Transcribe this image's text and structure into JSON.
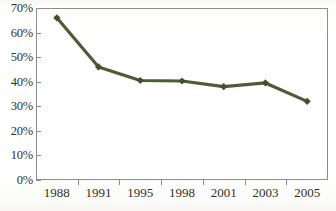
{
  "chart_data": {
    "type": "line",
    "title": "",
    "subtitle": "",
    "xlabel": "",
    "ylabel": "",
    "categories": [
      "1988",
      "1991",
      "1995",
      "1998",
      "2001",
      "2003",
      "2005"
    ],
    "values": [
      66,
      46,
      40.5,
      40.3,
      38,
      39.5,
      32
    ],
    "series": [
      {
        "name": "",
        "values": [
          66,
          46,
          40.5,
          40.3,
          38,
          39.5,
          32
        ]
      }
    ],
    "ylim": [
      0,
      70
    ],
    "y_ticks": [
      0,
      10,
      20,
      30,
      40,
      50,
      60,
      70
    ],
    "y_tick_labels": [
      "0%",
      "10%",
      "20%",
      "30%",
      "40%",
      "50%",
      "60%",
      "70%"
    ],
    "x_tick_labels": [
      "1988",
      "1991",
      "1995",
      "1998",
      "2001",
      "2003",
      "2005"
    ],
    "grid": false,
    "legend": false,
    "legend_position": "none",
    "marker": "diamond",
    "annotations": [],
    "colors": {
      "line": "#4a5d33",
      "marker": "#415029",
      "axis": "#8d8d8d",
      "tick_label": "#2f2f2f",
      "background": "#fefefe"
    }
  }
}
